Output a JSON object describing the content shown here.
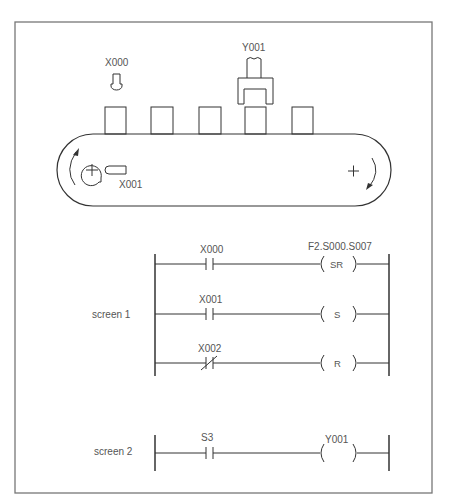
{
  "conveyor": {
    "sensor_top_label": "X000",
    "actuator_label": "Y001",
    "sensor_roller_label": "X001",
    "box_count": 5
  },
  "screen1": {
    "label": "screen 1",
    "rungs": [
      {
        "contact": "X000",
        "contact_type": "NO",
        "coil": "SR",
        "coil_header": "F2.S000.S007"
      },
      {
        "contact": "X001",
        "contact_type": "NO",
        "coil": "S"
      },
      {
        "contact": "X002",
        "contact_type": "NC",
        "coil": "R"
      }
    ]
  },
  "screen2": {
    "label": "screen 2",
    "rungs": [
      {
        "contact": "S3",
        "contact_type": "NO",
        "coil": "",
        "coil_header": "Y001"
      }
    ]
  },
  "colors": {
    "line": "#333333",
    "text": "#555555",
    "frame": "#777777"
  }
}
